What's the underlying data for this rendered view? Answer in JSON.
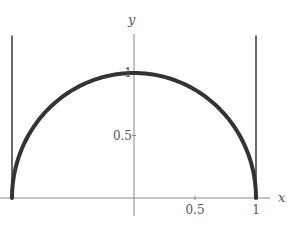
{
  "chart_data": {
    "type": "line",
    "title": "",
    "xlabel": "x",
    "ylabel": "y",
    "xlim": [
      -1.0,
      1.2
    ],
    "ylim": [
      0,
      1.0
    ],
    "x_ticks": [
      {
        "value": 0.5,
        "label": "0.5"
      },
      {
        "value": 1,
        "label": "1"
      }
    ],
    "y_ticks": [
      {
        "value": 0.5,
        "label": "0.5"
      },
      {
        "value": 1,
        "label": "1"
      }
    ],
    "grid": false,
    "series": [
      {
        "name": "semicircle",
        "function": "y = sqrt(1 - x^2)",
        "x_range": [
          -1,
          1
        ],
        "color": "#333333"
      }
    ],
    "vertical_lines": [
      {
        "name": "asymptote-left",
        "x": -1,
        "y_range": [
          0,
          1.3
        ],
        "color": "#444444"
      },
      {
        "name": "asymptote-right",
        "x": 1,
        "y_range": [
          0,
          1.3
        ],
        "color": "#444444"
      }
    ]
  }
}
